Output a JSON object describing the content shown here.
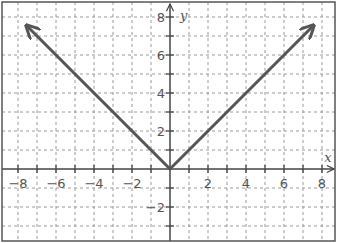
{
  "chart_data": {
    "type": "line",
    "title": "",
    "xlabel": "x",
    "ylabel": "y",
    "xlim": [
      -8.8,
      8.8
    ],
    "ylim": [
      -3.8,
      8.8
    ],
    "grid": true,
    "grid_step": 1,
    "x_ticks": [
      -8,
      -6,
      -4,
      -2,
      2,
      4,
      6,
      8
    ],
    "x_tick_labels": [
      "−8",
      "−6",
      "−4",
      "−2",
      "2",
      "4",
      "6",
      "8"
    ],
    "y_ticks": [
      8,
      6,
      4,
      2,
      -2
    ],
    "y_tick_labels": [
      "8",
      "6",
      "4",
      "2",
      "−2"
    ],
    "series": [
      {
        "name": "y = |x|",
        "x": [
          -7.5,
          0,
          7.5
        ],
        "y": [
          7.5,
          0,
          7.5
        ],
        "arrows_at_ends": true,
        "color": "#555555"
      }
    ]
  },
  "colors": {
    "grid": "#9a9a9a",
    "axis": "#444444",
    "curve": "#555555",
    "frame": "#555555"
  }
}
